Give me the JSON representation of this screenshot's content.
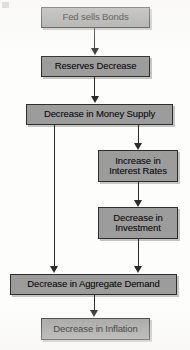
{
  "diagram": {
    "type": "flowchart",
    "orientation": "top-to-bottom",
    "background_color": "#fdfdfc",
    "node_fill_color": "#9c9c9c",
    "node_border_color": "#2e2e2e",
    "connector_color": "#2b2b2b",
    "nodes": [
      {
        "id": "fed-sells-bonds",
        "label": "Fed sells Bonds"
      },
      {
        "id": "reserves-decrease",
        "label": "Reserves Decrease"
      },
      {
        "id": "decrease-money-supply",
        "label": "Decrease in Money Supply"
      },
      {
        "id": "increase-interest-rates",
        "label": "Increase in\nInterest Rates"
      },
      {
        "id": "decrease-investment",
        "label": "Decrease in\nInvestment"
      },
      {
        "id": "decrease-aggregate-demand",
        "label": "Decrease in Aggregate Demand"
      },
      {
        "id": "decrease-inflation",
        "label": "Decrease in Inflation"
      }
    ],
    "edges": [
      {
        "from": "fed-sells-bonds",
        "to": "reserves-decrease"
      },
      {
        "from": "reserves-decrease",
        "to": "decrease-money-supply"
      },
      {
        "from": "decrease-money-supply",
        "to": "increase-interest-rates"
      },
      {
        "from": "decrease-money-supply",
        "to": "decrease-aggregate-demand"
      },
      {
        "from": "increase-interest-rates",
        "to": "decrease-investment"
      },
      {
        "from": "decrease-investment",
        "to": "decrease-aggregate-demand"
      },
      {
        "from": "decrease-aggregate-demand",
        "to": "decrease-inflation"
      }
    ]
  }
}
